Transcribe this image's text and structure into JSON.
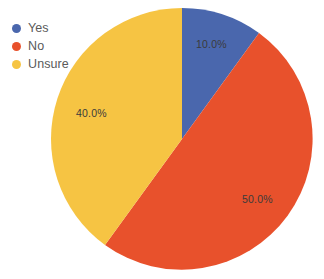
{
  "chart_data": {
    "type": "pie",
    "title": "",
    "categories": [
      "Yes",
      "No",
      "Unsure"
    ],
    "values": [
      10.0,
      50.0,
      40.0
    ],
    "value_unit": "%",
    "data_labels": [
      "10.0%",
      "50.0%",
      "40.0%"
    ],
    "colors": [
      "#4A67AD",
      "#E8512C",
      "#F6C443"
    ],
    "legend_position": "top-left",
    "grid": false,
    "start_angle_deg": 0,
    "direction": "clockwise",
    "series": [
      {
        "name": "Responses",
        "values": [
          10.0,
          50.0,
          40.0
        ]
      }
    ],
    "slices": [
      {
        "label": "Yes",
        "value": 10.0,
        "display": "10.0%",
        "color": "#4A67AD"
      },
      {
        "label": "No",
        "value": 50.0,
        "display": "50.0%",
        "color": "#E8512C"
      },
      {
        "label": "Unsure",
        "value": 40.0,
        "display": "40.0%",
        "color": "#F6C443"
      }
    ]
  },
  "legend": {
    "items": [
      {
        "label": "Yes",
        "color": "#4A67AD"
      },
      {
        "label": "No",
        "color": "#E8512C"
      },
      {
        "label": "Unsure",
        "color": "#F6C443"
      }
    ]
  },
  "labels": {
    "yes": "10.0%",
    "no": "50.0%",
    "unsure": "40.0%"
  },
  "geometry": {
    "center_x": 182,
    "center_y": 139,
    "radius": 131
  }
}
